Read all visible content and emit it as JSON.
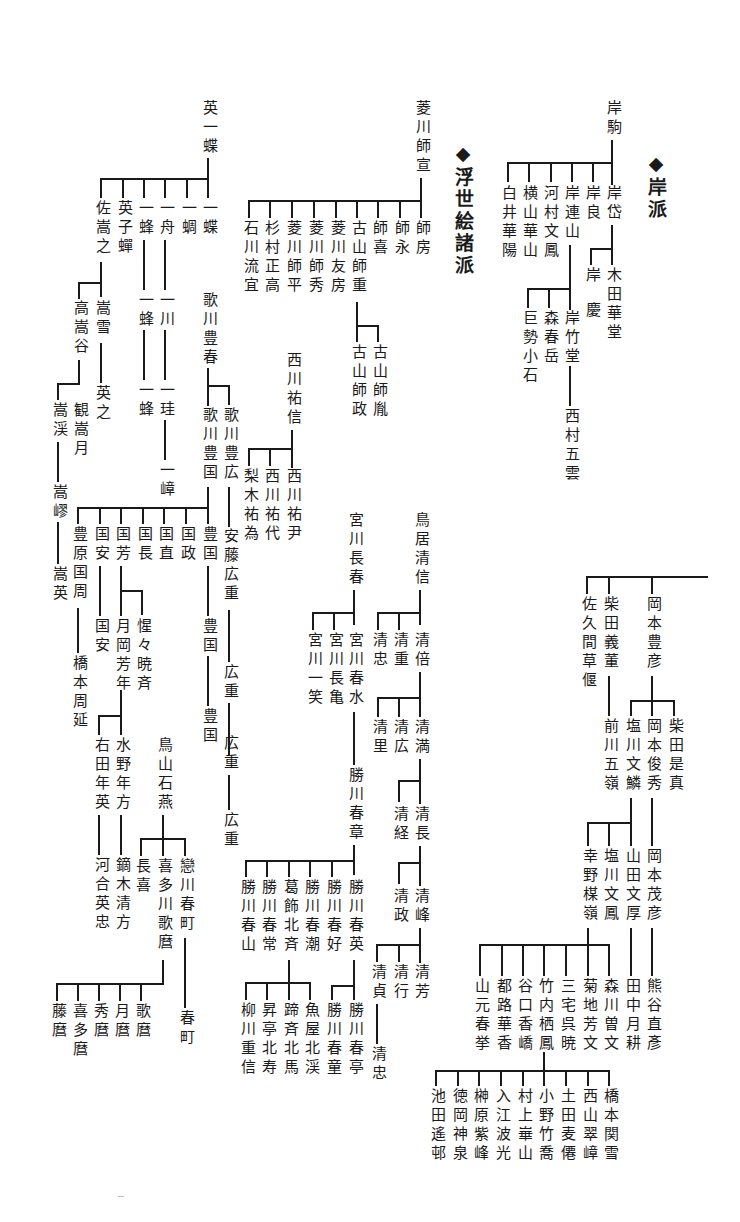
{
  "headings": {
    "kishi_ha": "◆岸派",
    "ukiyoe_shoha": "◆浮世絵諸派"
  },
  "kishi": {
    "root": "岸駒",
    "children": [
      "岸岱",
      "岸良",
      "岸連山",
      "河村文鳳",
      "横山華山",
      "白井華陽"
    ],
    "gantai_children": [
      "木田華堂",
      "岸慶"
    ],
    "renzan_children": [
      "岸竹堂",
      "森春岳",
      "巨勢小石"
    ],
    "chikudo_child": "西村五雲"
  },
  "hishikawa": {
    "root": "菱川師宣",
    "children": [
      "師房",
      "師永",
      "師喜",
      "古山師重",
      "菱川友房",
      "菱川師秀",
      "菱川師平",
      "杉村正高",
      "石川流宜"
    ],
    "moroshige_children": [
      "古山師胤",
      "古山師政"
    ]
  },
  "hanabusa": {
    "root": "英一蝶",
    "children": [
      "一蝶",
      "一蜩",
      "一舟",
      "一蜂",
      "英子蟬",
      "佐嵩之"
    ],
    "isshu_line": [
      "一川",
      "一珪",
      "一嶂"
    ],
    "ippo_line": [
      "一蜂",
      "一蜂"
    ],
    "sukeyuki_children": [
      "嵩雪",
      "高嵩谷"
    ],
    "suusetsu_child": "英之",
    "kokoku_children": [
      "観嵩月",
      "嵩渓"
    ],
    "kokei_line": [
      "嵩嵺",
      "嵩英"
    ]
  },
  "utagawa": {
    "root": "歌川豊春",
    "children": [
      "歌川豊広",
      "歌川豊国"
    ],
    "toyohiro_line": [
      "安藤広重",
      "広重",
      "広重",
      "広重"
    ],
    "toyokuni_children": [
      "豊国",
      "国政",
      "国直",
      "国長",
      "国芳",
      "国安",
      "豊原国周"
    ],
    "toyokuni_line": [
      "豊国",
      "豊国"
    ],
    "kuniyasu_child": "国安",
    "kuniyoshi_children": [
      "月岡芳年",
      "惺々暁斉"
    ],
    "yoshitoshi_children": [
      "水野年方",
      "右田年英"
    ],
    "toshikata_child": "鏑木清方",
    "toshihide_child": "河合英忠",
    "kunichika_child": "橋本周延"
  },
  "nishikawa": {
    "root": "西川祐信",
    "children": [
      "西川祐尹",
      "西川祐代",
      "梨木祐為"
    ]
  },
  "toriyama": {
    "root": "鳥山石燕",
    "children": [
      "戀川春町",
      "喜多川歌麿",
      "長喜"
    ],
    "harumachi_child": "春町",
    "utamaro_children": [
      "歌麿",
      "月麿",
      "秀麿",
      "喜多麿",
      "藤麿"
    ]
  },
  "miyagawa": {
    "root": "宮川長春",
    "children": [
      "宮川春水",
      "宮川長亀",
      "宮川一笑"
    ],
    "shunsui_child": "勝川春章",
    "shunsho_children": [
      "勝川春英",
      "勝川春好",
      "勝川春潮",
      "葛飾北斉",
      "勝川春常",
      "勝川春山"
    ],
    "shunei_children": [
      "勝川春亭",
      "勝川春童"
    ],
    "hokusai_children": [
      "魚屋北渓",
      "蹄斉北馬",
      "昇亭北寿",
      "柳川重信"
    ]
  },
  "torii": {
    "root": "鳥居清信",
    "children": [
      "清倍",
      "清重",
      "清忠"
    ],
    "kiyomasu_children": [
      "清満",
      "清広",
      "清里"
    ],
    "kiyomitsu_children": [
      "清長",
      "清経"
    ],
    "kiyonaga_children": [
      "清峰",
      "清政"
    ],
    "kiyomine_children": [
      "清芳",
      "清行",
      "清貞"
    ],
    "kiyosada_child": "清忠"
  },
  "okamoto": {
    "children": [
      "岡本豊彦",
      "柴田義董",
      "佐久間草偃"
    ],
    "gito_child": "前川五嶺",
    "toyohiko_children": [
      "柴田是真",
      "岡本俊秀",
      "塩川文鱗"
    ],
    "shunshu_child": "岡本茂彦",
    "shigehiko_child": "熊谷直彥",
    "bunrin_children": [
      "山田文厚",
      "塩川文鳳",
      "幸野楳嶺"
    ],
    "bunko_child": "田中月耕",
    "bairei_children": [
      "森川曽文",
      "菊地芳文",
      "三宅呉暁",
      "竹内栖鳳",
      "谷口香嶠",
      "都路華香",
      "山元春挙"
    ],
    "seiho_children": [
      "橋本関雪",
      "西山翠嶂",
      "土田麦僊",
      "小野竹喬",
      "村上崋山",
      "入江波光",
      "榊原紫峰",
      "徳岡神泉",
      "池田遙邨"
    ]
  }
}
